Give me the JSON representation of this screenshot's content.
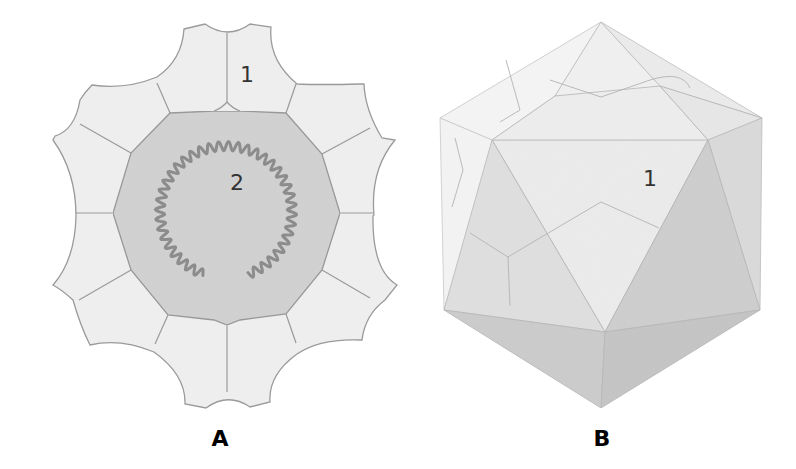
{
  "figure": {
    "panels": [
      {
        "label": "A",
        "view": "cross-section",
        "callouts": [
          {
            "number": "1",
            "target": "capsomere"
          },
          {
            "number": "2",
            "target": "nucleic acid core"
          }
        ]
      },
      {
        "label": "B",
        "view": "icosahedral surface",
        "callouts": [
          {
            "number": "1",
            "target": "capsomere face"
          }
        ]
      }
    ],
    "colors": {
      "capsomere_fill": "#eeeeee",
      "outline": "#9a9a9a",
      "core_fill": "#d2d2d2",
      "helix_stroke": "#8c8c8c",
      "face_light": "#efefef",
      "face_mid": "#dedede",
      "face_dark": "#c8c8c8"
    }
  }
}
